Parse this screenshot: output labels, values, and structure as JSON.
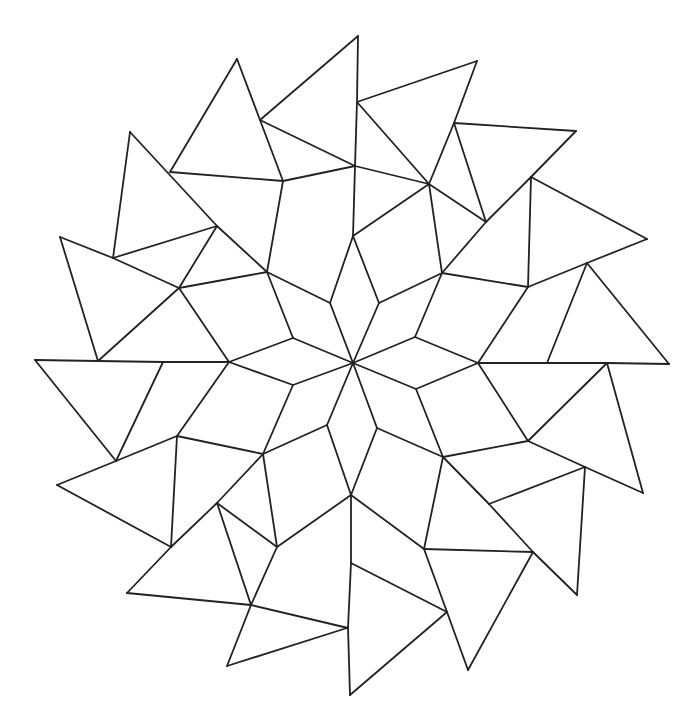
{
  "drawing": {
    "title": "",
    "description": "Hand-drawn line art of a pinwheel star tessellation: an 8-pointed star of rhombi at the center, surrounded by quadrilaterals and an outer ring of 16 triangles rotating like a pinwheel.",
    "stroke_color": "#222222",
    "background_color": "#ffffff",
    "stroke_width": 1.8,
    "center": [
      353,
      363
    ],
    "segments": [
      [
        [
          353,
          363
        ],
        [
          330,
          303
        ]
      ],
      [
        [
          353,
          363
        ],
        [
          379,
          303
        ]
      ],
      [
        [
          353,
          363
        ],
        [
          293,
          338
        ]
      ],
      [
        [
          353,
          363
        ],
        [
          415,
          337
        ]
      ],
      [
        [
          353,
          363
        ],
        [
          293,
          385
        ]
      ],
      [
        [
          353,
          363
        ],
        [
          416,
          389
        ]
      ],
      [
        [
          353,
          363
        ],
        [
          327,
          425
        ]
      ],
      [
        [
          353,
          363
        ],
        [
          377,
          428
        ]
      ],
      [
        [
          330,
          303
        ],
        [
          353,
          236
        ]
      ],
      [
        [
          353,
          236
        ],
        [
          379,
          303
        ]
      ],
      [
        [
          379,
          303
        ],
        [
          442,
          273
        ]
      ],
      [
        [
          442,
          273
        ],
        [
          415,
          337
        ]
      ],
      [
        [
          415,
          337
        ],
        [
          478,
          363
        ]
      ],
      [
        [
          478,
          363
        ],
        [
          416,
          389
        ]
      ],
      [
        [
          416,
          389
        ],
        [
          443,
          457
        ]
      ],
      [
        [
          443,
          457
        ],
        [
          377,
          428
        ]
      ],
      [
        [
          377,
          428
        ],
        [
          351,
          495
        ]
      ],
      [
        [
          351,
          495
        ],
        [
          327,
          425
        ]
      ],
      [
        [
          327,
          425
        ],
        [
          263,
          454
        ]
      ],
      [
        [
          263,
          454
        ],
        [
          293,
          385
        ]
      ],
      [
        [
          293,
          385
        ],
        [
          229,
          362
        ]
      ],
      [
        [
          229,
          362
        ],
        [
          293,
          338
        ]
      ],
      [
        [
          293,
          338
        ],
        [
          267,
          272
        ]
      ],
      [
        [
          267,
          272
        ],
        [
          330,
          303
        ]
      ],
      [
        [
          353,
          236
        ],
        [
          355,
          166
        ]
      ],
      [
        [
          353,
          236
        ],
        [
          429,
          184
        ]
      ],
      [
        [
          442,
          273
        ],
        [
          429,
          184
        ]
      ],
      [
        [
          442,
          273
        ],
        [
          528,
          287
        ]
      ],
      [
        [
          478,
          363
        ],
        [
          528,
          287
        ]
      ],
      [
        [
          478,
          363
        ],
        [
          528,
          441
        ]
      ],
      [
        [
          443,
          457
        ],
        [
          528,
          441
        ]
      ],
      [
        [
          443,
          457
        ],
        [
          424,
          549
        ]
      ],
      [
        [
          351,
          495
        ],
        [
          424,
          549
        ]
      ],
      [
        [
          351,
          495
        ],
        [
          277,
          547
        ]
      ],
      [
        [
          263,
          454
        ],
        [
          277,
          547
        ]
      ],
      [
        [
          263,
          454
        ],
        [
          177,
          436
        ]
      ],
      [
        [
          229,
          362
        ],
        [
          177,
          436
        ]
      ],
      [
        [
          229,
          362
        ],
        [
          179,
          288
        ]
      ],
      [
        [
          267,
          272
        ],
        [
          179,
          288
        ]
      ],
      [
        [
          267,
          272
        ],
        [
          283,
          181
        ]
      ],
      [
        [
          355,
          166
        ],
        [
          283,
          181
        ]
      ],
      [
        [
          429,
          184
        ],
        [
          355,
          166
        ]
      ],
      [
        [
          283,
          181
        ],
        [
          260,
          120
        ]
      ],
      [
        [
          260,
          120
        ],
        [
          355,
          166
        ]
      ],
      [
        [
          260,
          120
        ],
        [
          237,
          59
        ]
      ],
      [
        [
          237,
          59
        ],
        [
          170,
          172
        ]
      ],
      [
        [
          170,
          172
        ],
        [
          283,
          181
        ]
      ],
      [
        [
          260,
          120
        ],
        [
          358,
          36
        ]
      ],
      [
        [
          358,
          36
        ],
        [
          357,
          102
        ]
      ],
      [
        [
          357,
          102
        ],
        [
          355,
          166
        ]
      ],
      [
        [
          357,
          102
        ],
        [
          477,
          61
        ]
      ],
      [
        [
          477,
          61
        ],
        [
          454,
          123
        ]
      ],
      [
        [
          454,
          123
        ],
        [
          429,
          184
        ]
      ],
      [
        [
          357,
          102
        ],
        [
          429,
          184
        ]
      ],
      [
        [
          454,
          123
        ],
        [
          486,
          222
        ]
      ],
      [
        [
          454,
          123
        ],
        [
          576,
          131
        ]
      ],
      [
        [
          576,
          131
        ],
        [
          531,
          177
        ]
      ],
      [
        [
          531,
          177
        ],
        [
          486,
          222
        ]
      ],
      [
        [
          486,
          222
        ],
        [
          442,
          273
        ]
      ],
      [
        [
          486,
          222
        ],
        [
          429,
          184
        ]
      ],
      [
        [
          531,
          177
        ],
        [
          647,
          239
        ]
      ],
      [
        [
          647,
          239
        ],
        [
          587,
          263
        ]
      ],
      [
        [
          587,
          263
        ],
        [
          528,
          287
        ]
      ],
      [
        [
          531,
          177
        ],
        [
          528,
          287
        ]
      ],
      [
        [
          587,
          263
        ],
        [
          669,
          364
        ]
      ],
      [
        [
          669,
          364
        ],
        [
          607,
          363
        ]
      ],
      [
        [
          607,
          363
        ],
        [
          547,
          363
        ]
      ],
      [
        [
          547,
          363
        ],
        [
          478,
          363
        ]
      ],
      [
        [
          547,
          363
        ],
        [
          587,
          263
        ]
      ],
      [
        [
          607,
          363
        ],
        [
          643,
          493
        ]
      ],
      [
        [
          643,
          493
        ],
        [
          585,
          467
        ]
      ],
      [
        [
          585,
          467
        ],
        [
          528,
          441
        ]
      ],
      [
        [
          607,
          363
        ],
        [
          528,
          441
        ]
      ],
      [
        [
          585,
          467
        ],
        [
          489,
          504
        ]
      ],
      [
        [
          489,
          504
        ],
        [
          443,
          457
        ]
      ],
      [
        [
          585,
          467
        ],
        [
          577,
          595
        ]
      ],
      [
        [
          577,
          595
        ],
        [
          533,
          552
        ]
      ],
      [
        [
          533,
          552
        ],
        [
          489,
          504
        ]
      ],
      [
        [
          533,
          552
        ],
        [
          424,
          549
        ]
      ],
      [
        [
          533,
          552
        ],
        [
          468,
          670
        ]
      ],
      [
        [
          468,
          670
        ],
        [
          447,
          612
        ]
      ],
      [
        [
          447,
          612
        ],
        [
          424,
          549
        ]
      ],
      [
        [
          447,
          612
        ],
        [
          351,
          563
        ]
      ],
      [
        [
          351,
          563
        ],
        [
          351,
          495
        ]
      ],
      [
        [
          447,
          612
        ],
        [
          350,
          695
        ]
      ],
      [
        [
          350,
          695
        ],
        [
          348,
          628
        ]
      ],
      [
        [
          348,
          628
        ],
        [
          351,
          563
        ]
      ],
      [
        [
          348,
          628
        ],
        [
          251,
          605
        ]
      ],
      [
        [
          251,
          605
        ],
        [
          277,
          547
        ]
      ],
      [
        [
          251,
          605
        ],
        [
          227,
          666
        ]
      ],
      [
        [
          227,
          666
        ],
        [
          347,
          628
        ]
      ],
      [
        [
          277,
          547
        ],
        [
          217,
          503
        ]
      ],
      [
        [
          217,
          503
        ],
        [
          251,
          605
        ]
      ],
      [
        [
          217,
          503
        ],
        [
          263,
          454
        ]
      ],
      [
        [
          171,
          547
        ],
        [
          127,
          593
        ]
      ],
      [
        [
          127,
          593
        ],
        [
          251,
          605
        ]
      ],
      [
        [
          171,
          547
        ],
        [
          217,
          503
        ]
      ],
      [
        [
          171,
          547
        ],
        [
          177,
          436
        ]
      ],
      [
        [
          171,
          547
        ],
        [
          57,
          485
        ]
      ],
      [
        [
          57,
          485
        ],
        [
          116,
          461
        ]
      ],
      [
        [
          116,
          461
        ],
        [
          177,
          436
        ]
      ],
      [
        [
          116,
          461
        ],
        [
          163,
          362
        ]
      ],
      [
        [
          116,
          461
        ],
        [
          35,
          360
        ]
      ],
      [
        [
          35,
          360
        ],
        [
          98,
          361
        ]
      ],
      [
        [
          98,
          361
        ],
        [
          163,
          362
        ]
      ],
      [
        [
          163,
          362
        ],
        [
          229,
          362
        ]
      ],
      [
        [
          98,
          361
        ],
        [
          179,
          288
        ]
      ],
      [
        [
          98,
          361
        ],
        [
          60,
          237
        ]
      ],
      [
        [
          60,
          237
        ],
        [
          113,
          258
        ]
      ],
      [
        [
          113,
          258
        ],
        [
          179,
          288
        ]
      ],
      [
        [
          113,
          258
        ],
        [
          217,
          226
        ]
      ],
      [
        [
          113,
          258
        ],
        [
          130,
          132
        ]
      ],
      [
        [
          130,
          132
        ],
        [
          217,
          226
        ]
      ],
      [
        [
          217,
          226
        ],
        [
          267,
          272
        ]
      ],
      [
        [
          179,
          288
        ],
        [
          217,
          226
        ]
      ]
    ]
  }
}
